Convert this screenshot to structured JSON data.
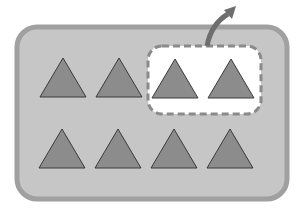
{
  "diagram": {
    "container": {
      "fill": "#c6c6c6",
      "stroke": "#9e9e9e"
    },
    "selection": {
      "fill": "#ffffff",
      "stroke": "#8a8a8a",
      "style": "dashed"
    },
    "arrow": {
      "color": "#6e6e6e",
      "direction": "up-right"
    },
    "triangle_color": "#8c8c8c",
    "triangle_stroke": "#3a3a3a",
    "rows": [
      {
        "count": 4,
        "selected": [
          2,
          3
        ]
      },
      {
        "count": 4,
        "selected": []
      }
    ]
  }
}
